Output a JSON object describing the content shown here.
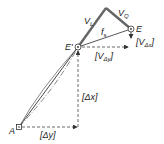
{
  "diagram": {
    "type": "geometry-vector-diagram",
    "colors": {
      "line": "#333333",
      "thick_line": "#666666",
      "dashed": "#444444",
      "background": "#ffffff"
    },
    "points": {
      "A": {
        "label": "A",
        "x": 19,
        "y": 127
      },
      "E_prime": {
        "label": "E'",
        "x": 78,
        "y": 47
      },
      "E": {
        "label": "E",
        "x": 131,
        "y": 29
      },
      "apex": {
        "x": 106,
        "y": 8
      }
    },
    "labels": {
      "V_L": {
        "main": "V",
        "sub": "L"
      },
      "V_Q": {
        "main": "V",
        "sub": "Q"
      },
      "f_s": {
        "main": "f",
        "sub": "s"
      },
      "E": "E",
      "E_prime": "E'",
      "A": "A",
      "V_dy": {
        "open": "[V",
        "sub": "Δy",
        "close": "]"
      },
      "V_dx": {
        "open": "[V",
        "sub": "Δx",
        "close": "]"
      },
      "dx": "[Δx]",
      "dy": "[Δy]"
    }
  }
}
